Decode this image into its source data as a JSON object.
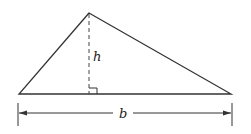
{
  "figure": {
    "type": "triangle-area-diagram",
    "labels": {
      "height": "h",
      "base": "b"
    },
    "colors": {
      "stroke": "#333333",
      "background": "#ffffff"
    }
  }
}
